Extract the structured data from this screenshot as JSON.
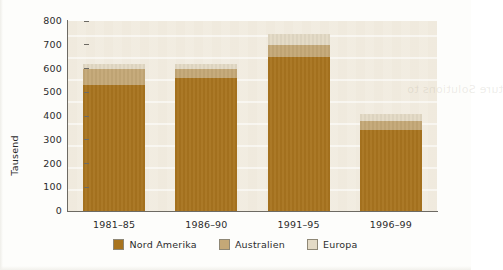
{
  "chart_data": {
    "type": "bar",
    "subtype": "stacked",
    "title": "",
    "xlabel": "",
    "ylabel": "Tausend",
    "categories": [
      "1981–85",
      "1986–90",
      "1991–95",
      "1996–99"
    ],
    "series": [
      {
        "name": "Nord Amerika",
        "color": "#a8741f",
        "values": [
          530,
          560,
          650,
          340
        ]
      },
      {
        "name": "Australien",
        "color": "#c4a877",
        "values": [
          70,
          40,
          50,
          40
        ]
      },
      {
        "name": "Europa",
        "color": "#e3dac5",
        "values": [
          20,
          20,
          45,
          30
        ]
      }
    ],
    "totals": [
      620,
      620,
      745,
      410
    ],
    "ylim": [
      0,
      800
    ],
    "yticks": [
      0,
      100,
      200,
      300,
      400,
      500,
      600,
      700,
      800
    ],
    "ytick_labels": [
      "0",
      "100",
      "200",
      "300",
      "400",
      "500",
      "600",
      "700",
      "800"
    ],
    "grid": true,
    "legend_position": "bottom",
    "legend": [
      "Nord Amerika",
      "Australien",
      "Europa"
    ],
    "plot_background": "#efe9dc",
    "axis_color": "#6d6a63"
  },
  "ghost_text": "ture Solutions   to",
  "icons": {
    "legend_swatch": "color-swatch-icon"
  }
}
